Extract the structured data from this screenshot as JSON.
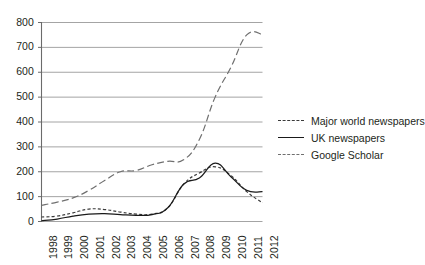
{
  "chart_data": {
    "type": "line",
    "title": "",
    "xlabel": "",
    "ylabel": "",
    "categories": [
      "1998",
      "1999",
      "2000",
      "2001",
      "2002",
      "2003",
      "2004",
      "2005",
      "2006",
      "2007",
      "2008",
      "2009",
      "2010",
      "2011",
      "2012"
    ],
    "yticks": [
      "0",
      "100",
      "200",
      "300",
      "400",
      "500",
      "600",
      "700",
      "800"
    ],
    "ylim": [
      0,
      800
    ],
    "grid": true,
    "legend_position": "right",
    "series": [
      {
        "name": "Major world newspapers",
        "style": "dotted",
        "color": "#3a3a3a",
        "values": [
          18,
          22,
          35,
          50,
          48,
          38,
          30,
          30,
          55,
          150,
          195,
          220,
          185,
          120,
          75
        ]
      },
      {
        "name": "UK newspapers",
        "style": "solid",
        "color": "#1a1a1a",
        "values": [
          3,
          10,
          22,
          30,
          32,
          28,
          25,
          28,
          55,
          150,
          175,
          235,
          180,
          125,
          120
        ]
      },
      {
        "name": "Google Scholar",
        "style": "dashed",
        "color": "#6f6f6f",
        "values": [
          65,
          78,
          95,
          125,
          165,
          200,
          205,
          228,
          242,
          248,
          330,
          500,
          620,
          750,
          752
        ]
      }
    ]
  },
  "legend": {
    "items": [
      {
        "label": "Major world newspapers"
      },
      {
        "label": "UK newspapers"
      },
      {
        "label": "Google Scholar"
      }
    ]
  }
}
